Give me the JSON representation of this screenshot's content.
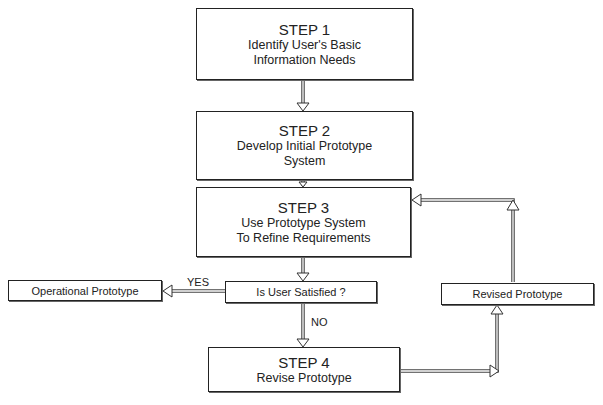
{
  "diagram": {
    "type": "flowchart",
    "steps": [
      {
        "id": "step1",
        "title": "STEP 1",
        "lines": [
          "Identify User's Basic",
          "Information Needs"
        ]
      },
      {
        "id": "step2",
        "title": "STEP 2",
        "lines": [
          "Develop Initial Prototype",
          "System"
        ]
      },
      {
        "id": "step3",
        "title": "STEP 3",
        "lines": [
          "Use Prototype System",
          "To Refine Requirements"
        ]
      },
      {
        "id": "step4",
        "title": "STEP 4",
        "lines": [
          "Revise Prototype"
        ]
      }
    ],
    "decision": {
      "label": "Is User Satisfied ?"
    },
    "outcomes": {
      "operational": "Operational Prototype",
      "revised": "Revised Prototype"
    },
    "edge_labels": {
      "yes": "YES",
      "no": "NO"
    }
  }
}
